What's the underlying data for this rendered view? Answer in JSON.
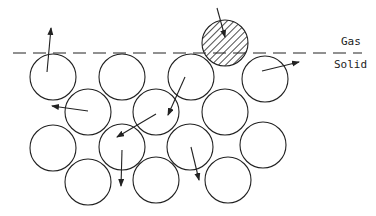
{
  "labels": {
    "gas": "Gas",
    "solid": "Solid"
  },
  "colors": {
    "stroke": "#222222",
    "background": "#ffffff"
  },
  "interface_line": {
    "y": 53,
    "x1": 13,
    "x2": 362,
    "style": "dashed"
  },
  "atom_radius": 23,
  "atoms": [
    {
      "cx": 53,
      "cy": 77,
      "hatched": false
    },
    {
      "cx": 122,
      "cy": 77,
      "hatched": false
    },
    {
      "cx": 191,
      "cy": 77,
      "hatched": false
    },
    {
      "cx": 225,
      "cy": 43,
      "hatched": true
    },
    {
      "cx": 265,
      "cy": 79,
      "hatched": false
    },
    {
      "cx": 88,
      "cy": 112,
      "hatched": false
    },
    {
      "cx": 156,
      "cy": 112,
      "hatched": false
    },
    {
      "cx": 225,
      "cy": 112,
      "hatched": false
    },
    {
      "cx": 53,
      "cy": 148,
      "hatched": false
    },
    {
      "cx": 122,
      "cy": 147,
      "hatched": false
    },
    {
      "cx": 190,
      "cy": 147,
      "hatched": false
    },
    {
      "cx": 263,
      "cy": 145,
      "hatched": false
    },
    {
      "cx": 88,
      "cy": 182,
      "hatched": false
    },
    {
      "cx": 156,
      "cy": 180,
      "hatched": false
    },
    {
      "cx": 228,
      "cy": 180,
      "hatched": false
    }
  ],
  "arrows": [
    {
      "x1": 47,
      "y1": 72,
      "x2": 51,
      "y2": 28
    },
    {
      "x1": 217,
      "y1": 8,
      "x2": 225,
      "y2": 37
    },
    {
      "x1": 262,
      "y1": 71,
      "x2": 299,
      "y2": 62
    },
    {
      "x1": 88,
      "y1": 111,
      "x2": 52,
      "y2": 106
    },
    {
      "x1": 185,
      "y1": 77,
      "x2": 168,
      "y2": 115
    },
    {
      "x1": 156,
      "y1": 114,
      "x2": 117,
      "y2": 137
    },
    {
      "x1": 122,
      "y1": 150,
      "x2": 121,
      "y2": 186
    },
    {
      "x1": 191,
      "y1": 147,
      "x2": 199,
      "y2": 180
    }
  ]
}
